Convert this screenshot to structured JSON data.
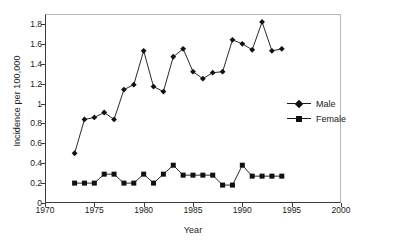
{
  "chart_data": {
    "type": "line",
    "title": "",
    "xlabel": "Year",
    "ylabel": "Incidence per 100,000",
    "xlim": [
      1970,
      2000
    ],
    "ylim": [
      0,
      1.9
    ],
    "grid": false,
    "legend_position": "right-middle",
    "xticks": [
      1970,
      1975,
      1980,
      1985,
      1990,
      1995,
      2000
    ],
    "xtick_labels": [
      "1970",
      "1975",
      "1980",
      "1985",
      "1990",
      "1995",
      "2000"
    ],
    "yticks": [
      0,
      0.2,
      0.4,
      0.6,
      0.8,
      1,
      1.2,
      1.4,
      1.6,
      1.8
    ],
    "ytick_labels": [
      "0",
      "0.2",
      "0.4",
      "0.6",
      "0.8",
      "1",
      "1.2",
      "1.4",
      "1.6",
      "1.8"
    ],
    "x": [
      1973,
      1974,
      1975,
      1976,
      1977,
      1978,
      1979,
      1980,
      1981,
      1982,
      1983,
      1984,
      1985,
      1986,
      1987,
      1988,
      1989,
      1990,
      1991,
      1992,
      1993,
      1994
    ],
    "series": [
      {
        "name": "Male",
        "marker": "diamond",
        "color": "#111111",
        "values": [
          0.5,
          0.84,
          0.86,
          0.91,
          0.84,
          1.14,
          1.19,
          1.53,
          1.17,
          1.12,
          1.47,
          1.55,
          1.32,
          1.25,
          1.31,
          1.32,
          1.64,
          1.6,
          1.54,
          1.82,
          1.53,
          1.55
        ]
      },
      {
        "name": "Female",
        "marker": "square",
        "color": "#111111",
        "values": [
          0.2,
          0.2,
          0.2,
          0.29,
          0.29,
          0.2,
          0.2,
          0.29,
          0.2,
          0.29,
          0.38,
          0.28,
          0.28,
          0.28,
          0.28,
          0.18,
          0.18,
          0.38,
          0.27,
          0.27,
          0.27,
          0.27
        ]
      }
    ]
  },
  "legend": {
    "items": [
      {
        "label": "Male"
      },
      {
        "label": "Female"
      }
    ]
  }
}
